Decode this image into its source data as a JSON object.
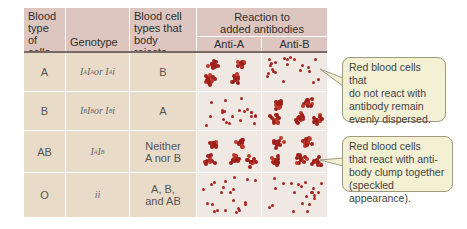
{
  "headers": {
    "blood_type": "Blood type of cells",
    "blood_type_lines": [
      "Blood",
      "type",
      "of cells"
    ],
    "genotype": "Genotype",
    "rejects_lines": [
      "Blood cell",
      "types that",
      "body rejects"
    ],
    "reaction_lines": [
      "Reaction to",
      "added antibodies"
    ],
    "anti_a": "Anti-A",
    "anti_b": "Anti-B"
  },
  "rows": [
    {
      "type": "A",
      "genotype_html": "I<sup>A</sup>I<sup>A</sup> or I<sup>A</sup>i",
      "genotype": "IAIA or IAi",
      "rejects_lines": [
        "B"
      ],
      "anti_a": "clumped",
      "anti_b": "dispersed"
    },
    {
      "type": "B",
      "genotype_html": "I<sup>B</sup>I<sup>B</sup> or I<sup>B</sup>i",
      "genotype": "IBIB or IBi",
      "rejects_lines": [
        "A"
      ],
      "anti_a": "dispersed",
      "anti_b": "clumped"
    },
    {
      "type": "AB",
      "genotype_html": "I<sup>A</sup>I<sup>B</sup>",
      "genotype": "IAIB",
      "rejects_lines": [
        "Neither",
        "A nor B"
      ],
      "anti_a": "clumped",
      "anti_b": "clumped"
    },
    {
      "type": "O",
      "genotype_html": "ii",
      "genotype": "ii",
      "rejects_lines": [
        "A, B,",
        "and AB"
      ],
      "anti_a": "dispersed",
      "anti_b": "dispersed"
    }
  ],
  "callouts": {
    "dispersed": "Red blood cells that do not react with antibody remain evenly dispersed.",
    "dispersed_lines": [
      "Red blood cells that",
      "do not react with",
      "antibody remain",
      "evenly dispersed."
    ],
    "clumped": "Red blood cells that react with antibody clump together (speckled appearance).",
    "clumped_lines": [
      "Red blood cells",
      "that react with anti-",
      "body clump together",
      "(speckled appearance)."
    ]
  },
  "colors": {
    "header_bg": "#ddc6bf",
    "cell_bg": "#e8dcc8",
    "reaction_bg": "#f0e8e3",
    "blood_cell": "#a8241f",
    "callout_bg": "#f3f0d4"
  }
}
